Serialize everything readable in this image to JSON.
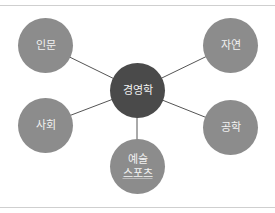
{
  "diagram": {
    "center": {
      "label": "경영학",
      "color": "#4a4a4a"
    },
    "nodes": [
      {
        "id": "humanities",
        "label": "인문",
        "color": "#8c8c8c"
      },
      {
        "id": "nature",
        "label": "자연",
        "color": "#8c8c8c"
      },
      {
        "id": "society",
        "label": "사회",
        "color": "#8c8c8c"
      },
      {
        "id": "engineering",
        "label": "공학",
        "color": "#8c8c8c"
      },
      {
        "id": "arts-sports",
        "label": "예술",
        "sublabel": "스포츠",
        "color": "#8c8c8c"
      }
    ],
    "line_color": "#555555",
    "rule_color": "#cfcfcf"
  }
}
